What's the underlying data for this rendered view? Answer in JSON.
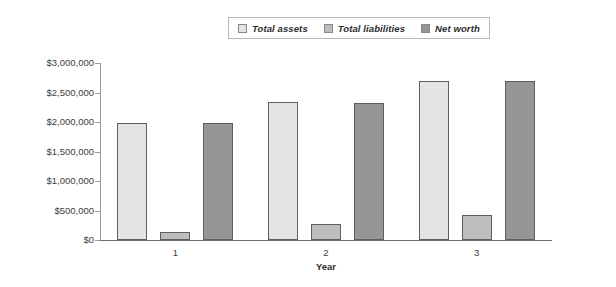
{
  "chart_data": {
    "type": "bar",
    "title": "",
    "xlabel": "Year",
    "ylabel": "",
    "categories": [
      "1",
      "2",
      "3"
    ],
    "series": [
      {
        "name": "Total assets",
        "color": "#e4e4e4",
        "values": [
          1990000,
          2340000,
          2700000
        ]
      },
      {
        "name": "Total liabilities",
        "color": "#bdbdbd",
        "values": [
          140000,
          270000,
          430000
        ]
      },
      {
        "name": "Net worth",
        "color": "#969696",
        "values": [
          1975000,
          2330000,
          2700000
        ]
      }
    ],
    "ylim": [
      0,
      3000000
    ],
    "ytick_values": [
      3000000,
      2500000,
      2000000,
      1500000,
      1000000,
      500000,
      0
    ],
    "ytick_labels": [
      "$3,000,000",
      "$2,500,000",
      "$2,000,000",
      "$1,500,000",
      "$1,000,000",
      "$500,000",
      "$0"
    ],
    "grid": false,
    "legend_position": "top-center"
  },
  "legend": {
    "items": [
      {
        "label": "Total assets",
        "swatch_color": "#e4e4e4"
      },
      {
        "label": "Total liabilities",
        "swatch_color": "#bdbdbd"
      },
      {
        "label": "Net worth",
        "swatch_color": "#969696"
      }
    ]
  },
  "axes": {
    "x_title": "Year",
    "x_categories": [
      "1",
      "2",
      "3"
    ],
    "y_labels": [
      "$3,000,000",
      "$2,500,000",
      "$2,000,000",
      "$1,500,000",
      "$1,000,000",
      "$500,000",
      "$0"
    ]
  },
  "colors": {
    "axis": "#6f6f6f",
    "bar_border": "#5f5f5f",
    "background": "#ffffff"
  }
}
